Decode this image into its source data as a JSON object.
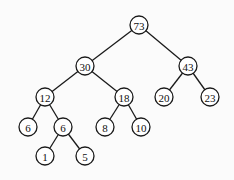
{
  "diagram": {
    "type": "binary-tree",
    "node_radius": 9,
    "colors": {
      "stroke": "#1a1a1a",
      "fill": "#ffffff",
      "background": "#fbfbfb"
    },
    "nodes": [
      {
        "id": "n73",
        "label": "73",
        "x": 139,
        "y": 25
      },
      {
        "id": "n30",
        "label": "30",
        "x": 85,
        "y": 66
      },
      {
        "id": "n43",
        "label": "43",
        "x": 188,
        "y": 66
      },
      {
        "id": "n12",
        "label": "12",
        "x": 45,
        "y": 97
      },
      {
        "id": "n18",
        "label": "18",
        "x": 124,
        "y": 97
      },
      {
        "id": "n20",
        "label": "20",
        "x": 164,
        "y": 97
      },
      {
        "id": "n23",
        "label": "23",
        "x": 210,
        "y": 97
      },
      {
        "id": "n6a",
        "label": "6",
        "x": 28,
        "y": 127
      },
      {
        "id": "n6b",
        "label": "6",
        "x": 63,
        "y": 127
      },
      {
        "id": "n8",
        "label": "8",
        "x": 105,
        "y": 127
      },
      {
        "id": "n10",
        "label": "10",
        "x": 141,
        "y": 127
      },
      {
        "id": "n1",
        "label": "1",
        "x": 45,
        "y": 156
      },
      {
        "id": "n5",
        "label": "5",
        "x": 85,
        "y": 156
      }
    ],
    "edges": [
      [
        "n73",
        "n30"
      ],
      [
        "n73",
        "n43"
      ],
      [
        "n30",
        "n12"
      ],
      [
        "n30",
        "n18"
      ],
      [
        "n43",
        "n20"
      ],
      [
        "n43",
        "n23"
      ],
      [
        "n12",
        "n6a"
      ],
      [
        "n12",
        "n6b"
      ],
      [
        "n18",
        "n8"
      ],
      [
        "n18",
        "n10"
      ],
      [
        "n6b",
        "n1"
      ],
      [
        "n6b",
        "n5"
      ]
    ]
  }
}
